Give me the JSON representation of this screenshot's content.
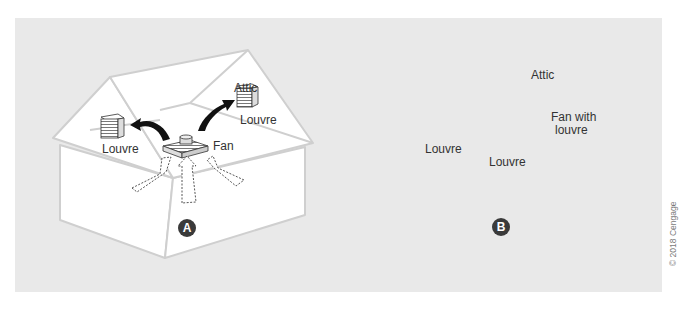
{
  "figure": {
    "panel_background": "#e9e9e9",
    "house_fill": "#ffffff",
    "house_outline": "#cfcfcf",
    "arrow_color": "#111111",
    "copyright": "© 2018 Cengage"
  },
  "diagram_a": {
    "badge": "A",
    "labels": {
      "attic": "Attic",
      "louvre_left": "Louvre",
      "louvre_right": "Louvre",
      "fan": "Fan"
    },
    "description": "Attic fan mounted in ceiling pulls air from living space (dashed arrows) and exhausts it through gable louvres (solid arrows)."
  },
  "diagram_b": {
    "badge": "B",
    "labels": {
      "attic": "Attic",
      "louvre_gable": "Louvre",
      "louvre_ceiling": "Louvre",
      "fan": "Fan with",
      "fan_line2": "louvre"
    },
    "description": "Outside air enters through gable louvre, flows across attic and is exhausted by a fan with louvre in the opposite gable."
  }
}
